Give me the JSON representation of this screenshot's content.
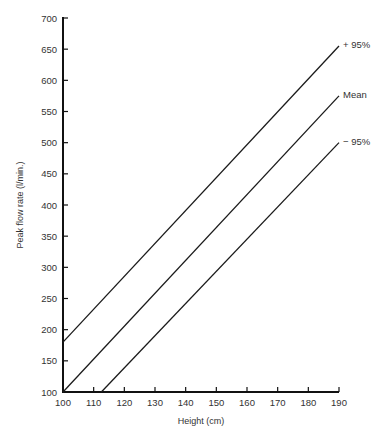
{
  "chart_data": {
    "type": "line",
    "title": "",
    "xlabel": "Height (cm)",
    "ylabel": "Peak flow rate (l/min.)",
    "xlim": [
      100,
      190
    ],
    "ylim": [
      100,
      700
    ],
    "x_ticks": [
      100,
      110,
      120,
      130,
      140,
      150,
      160,
      170,
      180,
      190
    ],
    "y_ticks": [
      100,
      150,
      200,
      250,
      300,
      350,
      400,
      450,
      500,
      550,
      600,
      650,
      700
    ],
    "grid": false,
    "legend_position": "inline labels at right end of lines",
    "series": [
      {
        "name": "+ 95%",
        "x": [
          100,
          190
        ],
        "y": [
          180,
          655
        ]
      },
      {
        "name": "Mean",
        "x": [
          100,
          190
        ],
        "y": [
          100,
          575
        ]
      },
      {
        "name": "− 95%",
        "x": [
          112.5,
          190
        ],
        "y": [
          100,
          500
        ]
      }
    ]
  },
  "labels": {
    "xlabel": "Height (cm)",
    "ylabel": "Peak flow rate (l/min.)",
    "series": [
      "+ 95%",
      "Mean",
      "− 95%"
    ]
  }
}
